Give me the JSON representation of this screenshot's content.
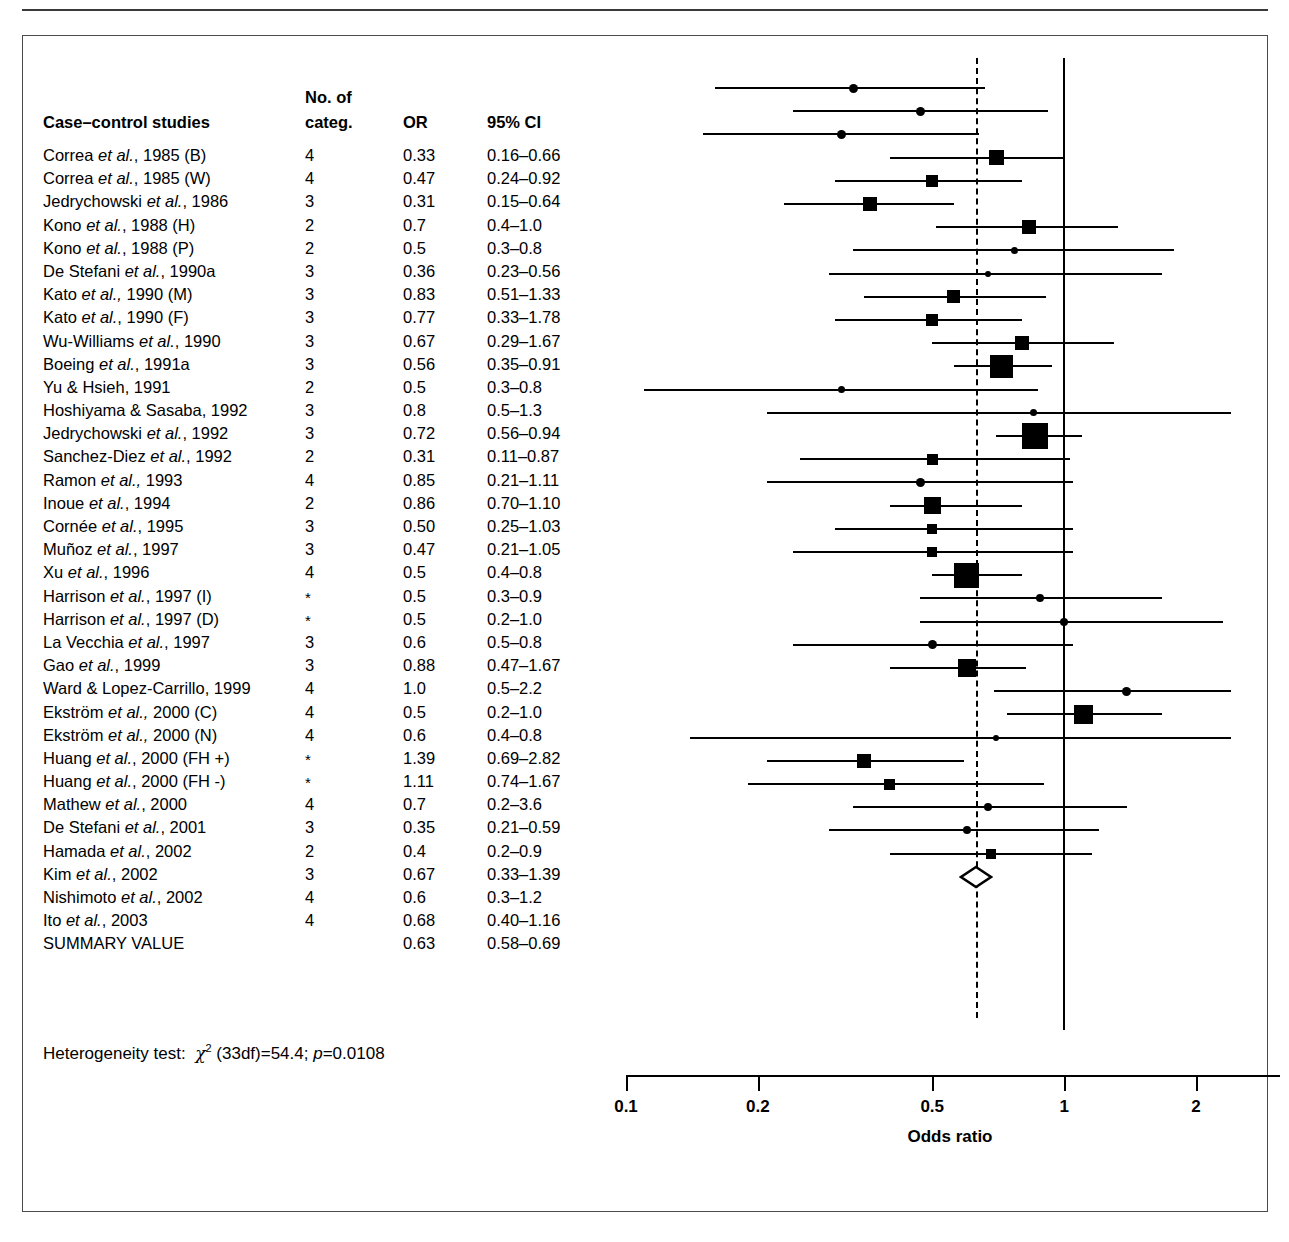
{
  "columns": {
    "study": "Case–control studies",
    "categ_line1": "No. of",
    "categ_line2": "categ.",
    "or": "OR",
    "ci": "95% CI"
  },
  "heterogeneity": {
    "prefix": "Heterogeneity test:",
    "chi": "χ",
    "exp": "2",
    "stat": "(33df)=54.4;",
    "p_italic": "p",
    "p_value": "=0.0108"
  },
  "axis": {
    "title": "Odds ratio",
    "ticks": [
      "0.1",
      "0.2",
      "0.5",
      "1",
      "2"
    ],
    "tick_values": [
      0.1,
      0.2,
      0.5,
      1,
      2
    ],
    "min": 0.1,
    "max": 2.3,
    "scale": "log"
  },
  "reference_lines": {
    "null_value": 1,
    "summary_value": 0.63
  },
  "chart_data": {
    "type": "forest",
    "title": "Case–control studies",
    "xlabel": "Odds ratio",
    "xlim": [
      0.1,
      2.3
    ],
    "xscale": "log",
    "grid": false,
    "legend": "none",
    "annotations": [
      "Heterogeneity test: χ2 (33df)=54.4; p=0.0108"
    ],
    "rows": [
      {
        "study_pre": "Correa ",
        "study_it": "et al.",
        "study_post": ", 1985 (B)",
        "categ": "4",
        "or": "0.33",
        "ci": "0.16–0.66",
        "est": 0.33,
        "lo": 0.16,
        "hi": 0.66,
        "w": 9
      },
      {
        "study_pre": "Correa ",
        "study_it": "et al.",
        "study_post": ", 1985 (W)",
        "categ": "4",
        "or": "0.47",
        "ci": "0.24–0.92",
        "est": 0.47,
        "lo": 0.24,
        "hi": 0.92,
        "w": 9
      },
      {
        "study_pre": "Jedrychowski ",
        "study_it": "et al.",
        "study_post": ", 1986",
        "categ": "3",
        "or": "0.31",
        "ci": "0.15–0.64",
        "est": 0.31,
        "lo": 0.15,
        "hi": 0.64,
        "w": 9
      },
      {
        "study_pre": "Kono ",
        "study_it": "et al.",
        "study_post": ", 1988 (H)",
        "categ": "2",
        "or": "0.7",
        "ci": "0.4–1.0",
        "est": 0.7,
        "lo": 0.4,
        "hi": 1.0,
        "w": 15
      },
      {
        "study_pre": "Kono ",
        "study_it": "et al.",
        "study_post": ", 1988 (P)",
        "categ": "2",
        "or": "0.5",
        "ci": "0.3–0.8",
        "est": 0.5,
        "lo": 0.3,
        "hi": 0.8,
        "w": 12
      },
      {
        "study_pre": "De Stefani ",
        "study_it": "et al.",
        "study_post": ", 1990a",
        "categ": "3",
        "or": "0.36",
        "ci": "0.23–0.56",
        "est": 0.36,
        "lo": 0.23,
        "hi": 0.56,
        "w": 14
      },
      {
        "study_pre": "Kato ",
        "study_it": "et al.,",
        "study_post": " 1990 (M)",
        "categ": "3",
        "or": "0.83",
        "ci": "0.51–1.33",
        "est": 0.83,
        "lo": 0.51,
        "hi": 1.33,
        "w": 14
      },
      {
        "study_pre": "Kato ",
        "study_it": "et al.",
        "study_post": ", 1990 (F)",
        "categ": "3",
        "or": "0.77",
        "ci": "0.33–1.78",
        "est": 0.77,
        "lo": 0.33,
        "hi": 1.78,
        "w": 7
      },
      {
        "study_pre": "Wu-Williams ",
        "study_it": "et al.",
        "study_post": ", 1990",
        "categ": "3",
        "or": "0.67",
        "ci": "0.29–1.67",
        "est": 0.67,
        "lo": 0.29,
        "hi": 1.67,
        "w": 6
      },
      {
        "study_pre": "Boeing ",
        "study_it": "et al.",
        "study_post": ", 1991a",
        "categ": "3",
        "or": "0.56",
        "ci": "0.35–0.91",
        "est": 0.56,
        "lo": 0.35,
        "hi": 0.91,
        "w": 13
      },
      {
        "study_pre": "Yu & Hsieh, 1991",
        "study_it": "",
        "study_post": "",
        "categ": "2",
        "or": "0.5",
        "ci": "0.3–0.8",
        "est": 0.5,
        "lo": 0.3,
        "hi": 0.8,
        "w": 12
      },
      {
        "study_pre": "Hoshiyama & Sasaba, 1992",
        "study_it": "",
        "study_post": "",
        "categ": "3",
        "or": "0.8",
        "ci": "0.5–1.3",
        "est": 0.8,
        "lo": 0.5,
        "hi": 1.3,
        "w": 14
      },
      {
        "study_pre": "Jedrychowski ",
        "study_it": "et al.",
        "study_post": ", 1992",
        "categ": "3",
        "or": "0.72",
        "ci": "0.56–0.94",
        "est": 0.72,
        "lo": 0.56,
        "hi": 0.94,
        "w": 23
      },
      {
        "study_pre": "Sanchez-Diez ",
        "study_it": "et al.",
        "study_post": ", 1992",
        "categ": "2",
        "or": "0.31",
        "ci": "0.11–0.87",
        "est": 0.31,
        "lo": 0.11,
        "hi": 0.87,
        "w": 7
      },
      {
        "study_pre": "Ramon ",
        "study_it": "et al.,",
        "study_post": " 1993",
        "categ": "4",
        "or": "0.85",
        "ci": "0.21–1.11",
        "est": 0.85,
        "lo": 0.21,
        "hi": 2.4,
        "w": 7
      },
      {
        "study_pre": "Inoue ",
        "study_it": "et al.",
        "study_post": ", 1994",
        "categ": "2",
        "or": "0.86",
        "ci": "0.70–1.10",
        "est": 0.86,
        "lo": 0.7,
        "hi": 1.1,
        "w": 27
      },
      {
        "study_pre": "Cornée ",
        "study_it": "et al.",
        "study_post": ", 1995",
        "categ": "3",
        "or": "0.50",
        "ci": "0.25–1.03",
        "est": 0.5,
        "lo": 0.25,
        "hi": 1.03,
        "w": 11
      },
      {
        "study_pre": "Muñoz ",
        "study_it": "et al.",
        "study_post": ", 1997",
        "categ": "3",
        "or": "0.47",
        "ci": "0.21–1.05",
        "est": 0.47,
        "lo": 0.21,
        "hi": 1.05,
        "w": 9
      },
      {
        "study_pre": "Xu ",
        "study_it": "et al.",
        "study_post": ", 1996",
        "categ": "4",
        "or": "0.5",
        "ci": "0.4–0.8",
        "est": 0.5,
        "lo": 0.4,
        "hi": 0.8,
        "w": 17
      },
      {
        "study_pre": "Harrison ",
        "study_it": "et al.",
        "study_post": ", 1997 (I)",
        "categ": "*",
        "or": "0.5",
        "ci": "0.3–0.9",
        "est": 0.5,
        "lo": 0.3,
        "hi": 1.05,
        "w": 10
      },
      {
        "study_pre": "Harrison ",
        "study_it": "et al.",
        "study_post": ", 1997 (D)",
        "categ": "*",
        "or": "0.5",
        "ci": "0.2–1.0",
        "est": 0.5,
        "lo": 0.24,
        "hi": 1.05,
        "w": 10
      },
      {
        "study_pre": "La Vecchia ",
        "study_it": "et al.",
        "study_post": ", 1997",
        "categ": "3",
        "or": "0.6",
        "ci": "0.5–0.8",
        "est": 0.6,
        "lo": 0.5,
        "hi": 0.8,
        "w": 25
      },
      {
        "study_pre": "Gao ",
        "study_it": "et al.",
        "study_post": ", 1999",
        "categ": "3",
        "or": "0.88",
        "ci": "0.47–1.67",
        "est": 0.88,
        "lo": 0.47,
        "hi": 1.67,
        "w": 8
      },
      {
        "study_pre": "Ward & Lopez-Carrillo, 1999",
        "study_it": "",
        "study_post": "",
        "categ": "4",
        "or": "1.0",
        "ci": "0.5–2.2",
        "est": 1.0,
        "lo": 0.47,
        "hi": 2.3,
        "w": 8
      },
      {
        "study_pre": "Ekström ",
        "study_it": "et al.,",
        "study_post": " 2000 (C)",
        "categ": "4",
        "or": "0.5",
        "ci": "0.2–1.0",
        "est": 0.5,
        "lo": 0.24,
        "hi": 1.05,
        "w": 9
      },
      {
        "study_pre": "Ekström ",
        "study_it": "et al.,",
        "study_post": " 2000 (N)",
        "categ": "4",
        "or": "0.6",
        "ci": "0.4–0.8",
        "est": 0.6,
        "lo": 0.4,
        "hi": 0.82,
        "w": 18
      },
      {
        "study_pre": "Huang ",
        "study_it": "et al.",
        "study_post": ", 2000 (FH +)",
        "categ": "*",
        "or": "1.39",
        "ci": "0.69–2.82",
        "est": 1.39,
        "lo": 0.69,
        "hi": 2.4,
        "w": 9
      },
      {
        "study_pre": "Huang ",
        "study_it": "et al.",
        "study_post": ", 2000 (FH -)",
        "categ": "*",
        "or": "1.11",
        "ci": "0.74–1.67",
        "est": 1.11,
        "lo": 0.74,
        "hi": 1.67,
        "w": 19
      },
      {
        "study_pre": "Mathew ",
        "study_it": "et al.",
        "study_post": ", 2000",
        "categ": "4",
        "or": "0.7",
        "ci": "0.2–3.6",
        "est": 0.7,
        "lo": 0.14,
        "hi": 2.4,
        "w": 6
      },
      {
        "study_pre": "De Stefani ",
        "study_it": "et al.",
        "study_post": ", 2001",
        "categ": "3",
        "or": "0.35",
        "ci": "0.21–0.59",
        "est": 0.35,
        "lo": 0.21,
        "hi": 0.59,
        "w": 14
      },
      {
        "study_pre": "Hamada ",
        "study_it": "et al.",
        "study_post": ", 2002",
        "categ": "2",
        "or": "0.4",
        "ci": "0.2–0.9",
        "est": 0.4,
        "lo": 0.19,
        "hi": 0.9,
        "w": 11
      },
      {
        "study_pre": "Kim ",
        "study_it": "et al.",
        "study_post": ", 2002",
        "categ": "3",
        "or": "0.67",
        "ci": "0.33–1.39",
        "est": 0.67,
        "lo": 0.33,
        "hi": 1.39,
        "w": 8
      },
      {
        "study_pre": "Nishimoto ",
        "study_it": "et al.",
        "study_post": ", 2002",
        "categ": "4",
        "or": "0.6",
        "ci": "0.3–1.2",
        "est": 0.6,
        "lo": 0.29,
        "hi": 1.2,
        "w": 8
      },
      {
        "study_pre": "Ito ",
        "study_it": "et al.",
        "study_post": ", 2003",
        "categ": "4",
        "or": "0.68",
        "ci": "0.40–1.16",
        "est": 0.68,
        "lo": 0.4,
        "hi": 1.16,
        "w": 10
      },
      {
        "study_pre": "SUMMARY VALUE",
        "study_it": "",
        "study_post": "",
        "categ": "",
        "or": "0.63",
        "ci": "0.58–0.69",
        "est": 0.63,
        "lo": 0.58,
        "hi": 0.69,
        "w": 0,
        "summary": true
      }
    ]
  }
}
